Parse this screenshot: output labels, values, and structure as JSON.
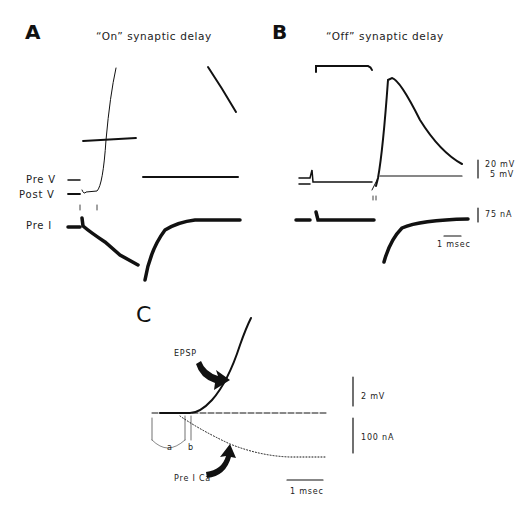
{
  "panels": {
    "A": {
      "letter": "A",
      "title": "“On” synaptic delay",
      "trace_labels": [
        "Pre V",
        "Post V",
        "Pre I"
      ]
    },
    "B": {
      "letter": "B",
      "title": "“Off” synaptic delay",
      "scale_bars": {
        "voltage_top": "20 mV",
        "voltage_bottom": "5 mV",
        "current": "75 nA",
        "time": "1 msec"
      }
    },
    "C": {
      "letter": "C",
      "trace_labels": [
        "EPSP",
        "Pre I Ca"
      ],
      "interval_labels": [
        "a",
        "b"
      ],
      "scale_bars": {
        "voltage": "2 mV",
        "current": "100 nA",
        "time": "1 msec"
      }
    }
  },
  "colors": {
    "trace": "#111111",
    "background": "#ffffff"
  }
}
